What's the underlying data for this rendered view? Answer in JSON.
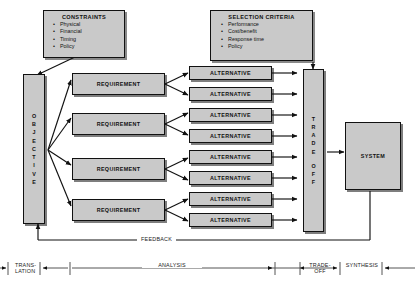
{
  "diagram": {
    "colors": {
      "box_fill": "#c9c9c9",
      "stroke": "#111111",
      "background": "#ffffff"
    },
    "panels": [
      {
        "id": "constraints",
        "title": "CONSTRAINTS",
        "items": [
          "Physical",
          "Financial",
          "Timing",
          "Policy"
        ]
      },
      {
        "id": "selection_criteria",
        "title": "SELECTION CRITERIA",
        "items": [
          "Performance",
          "Cost/benefit",
          "Response time",
          "Policy"
        ]
      }
    ],
    "objective_bar": {
      "label": "OBJECTIVE",
      "letters": [
        "O",
        "B",
        "J",
        "E",
        "C",
        "T",
        "I",
        "V",
        "E"
      ]
    },
    "tradeoff_bar": {
      "label": "TRADE OFF",
      "letters_top": [
        "T",
        "R",
        "A",
        "D",
        "E"
      ],
      "letters_bottom": [
        "O",
        "F",
        "F"
      ]
    },
    "requirements": [
      {
        "label": "REQUIREMENT"
      },
      {
        "label": "REQUIREMENT"
      },
      {
        "label": "REQUIREMENT"
      },
      {
        "label": "REQUIREMENT"
      }
    ],
    "alternatives": [
      {
        "label": "ALTERNATIVE"
      },
      {
        "label": "ALTERNATIVE"
      },
      {
        "label": "ALTERNATIVE"
      },
      {
        "label": "ALTERNATIVE"
      },
      {
        "label": "ALTERNATIVE"
      },
      {
        "label": "ALTERNATIVE"
      },
      {
        "label": "ALTERNATIVE"
      },
      {
        "label": "ALTERNATIVE"
      }
    ],
    "system_box": {
      "label": "SYSTEM"
    },
    "feedback_label": "FEEDBACK",
    "phases": [
      {
        "id": "translation",
        "line1": "TRANS-",
        "line2": "LATION"
      },
      {
        "id": "analysis",
        "line1": "ANALYSIS",
        "line2": ""
      },
      {
        "id": "tradeoff",
        "line1": "TRADE-",
        "line2": "OFF"
      },
      {
        "id": "synthesis",
        "line1": "SYNTHESIS",
        "line2": ""
      }
    ]
  }
}
